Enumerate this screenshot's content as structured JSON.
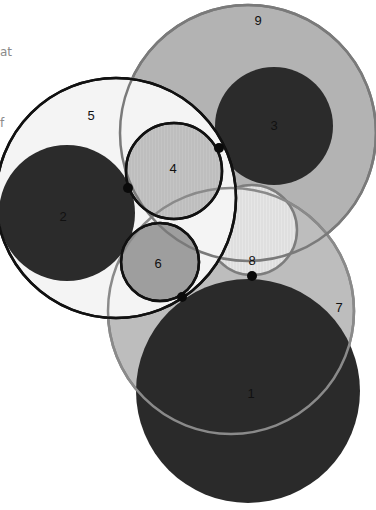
{
  "fragments": [
    {
      "text": "at",
      "x": 0,
      "y": 45
    },
    {
      "text": "f",
      "x": 0,
      "y": 116
    }
  ],
  "diagram": {
    "type": "overlapping-circles",
    "circles": [
      {
        "id": "9",
        "label": "9",
        "cx": 248,
        "cy": 133,
        "r": 128,
        "fill": "#b3b3b3",
        "stroke": "#7a7a7a",
        "stroke_width": 2.5,
        "label_x": 258,
        "label_y": 22
      },
      {
        "id": "3",
        "label": "3",
        "cx": 274,
        "cy": 126,
        "r": 59,
        "fill": "#2b2b2b",
        "stroke": "none",
        "stroke_width": 0,
        "label_x": 274,
        "label_y": 127
      },
      {
        "id": "7",
        "label": "7",
        "cx": 231,
        "cy": 311,
        "r": 123,
        "fill": "#bdbdbd",
        "stroke": "#808080",
        "stroke_width": 2.5,
        "label_x": 339,
        "label_y": 309
      },
      {
        "id": "8",
        "label": "8",
        "cx": 252,
        "cy": 230,
        "r": 45,
        "fill": "#e6e6e6",
        "stroke": "#7d7d7d",
        "stroke_width": 2.5,
        "label_x": 252,
        "label_y": 262
      },
      {
        "id": "5",
        "label": "5",
        "cx": 116,
        "cy": 198,
        "r": 120,
        "fill": "#f4f4f4",
        "stroke": "#111111",
        "stroke_width": 2.5,
        "label_x": 91,
        "label_y": 117
      },
      {
        "id": "2",
        "label": "2",
        "cx": 67,
        "cy": 213,
        "r": 68,
        "fill": "#2b2b2b",
        "stroke": "none",
        "stroke_width": 0,
        "label_x": 63,
        "label_y": 218
      },
      {
        "id": "4",
        "label": "4",
        "cx": 174,
        "cy": 171,
        "r": 48,
        "fill": "#c4c4c4",
        "stroke": "#111111",
        "stroke_width": 2.5,
        "label_x": 173,
        "label_y": 170
      },
      {
        "id": "6",
        "label": "6",
        "cx": 160,
        "cy": 262,
        "r": 39,
        "fill": "#9e9e9e",
        "stroke": "#111111",
        "stroke_width": 2.5,
        "label_x": 158,
        "label_y": 265
      },
      {
        "id": "1",
        "label": "1",
        "cx": 248,
        "cy": 391,
        "r": 112,
        "fill": "#2a2a2a",
        "stroke": "none",
        "stroke_width": 0,
        "label_x": 251,
        "label_y": 395
      }
    ],
    "overlay_arcs": [
      {
        "id": "7-outline-over-1",
        "cx": 231,
        "cy": 311,
        "r": 123,
        "stroke": "#8a8a8a"
      },
      {
        "id": "9-outline-over",
        "cx": 248,
        "cy": 133,
        "r": 128,
        "stroke": "#7a7a7a"
      },
      {
        "id": "5-outline-over",
        "cx": 116,
        "cy": 198,
        "r": 120,
        "stroke": "#111111"
      }
    ],
    "tangent_points": [
      {
        "x": 128,
        "y": 188
      },
      {
        "x": 219,
        "y": 148
      },
      {
        "x": 182,
        "y": 297
      },
      {
        "x": 252,
        "y": 276
      }
    ]
  }
}
